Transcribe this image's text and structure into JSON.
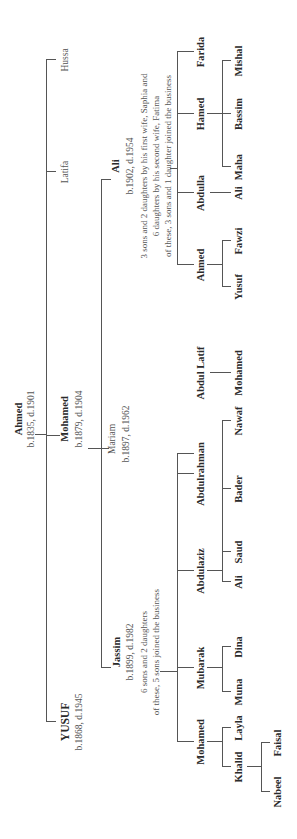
{
  "root": {
    "name": "Ahmed",
    "dates": "b.1835, d.1901"
  },
  "second_wife_line": {
    "name": "Mohamed",
    "dates": "b.1879, d.1904"
  },
  "mariam": {
    "name": "Mariam",
    "dates": "b.1897, d.1962"
  },
  "yusuf": {
    "name": "YUSUF",
    "dates": "b.1868, d.1945"
  },
  "latifa": {
    "name": "Latifa"
  },
  "hussa": {
    "name": "Hussa"
  },
  "jassim": {
    "name": "Jassim",
    "dates": "b.1899, d.1982",
    "note1": "6 sons and 2 daughters",
    "note2": "of these, 5 sons joined the business",
    "children": [
      {
        "name": "Mohamed",
        "children": [
          {
            "name": "Khalid",
            "children": [
              {
                "name": "Nabeel"
              },
              {
                "name": "Faisal"
              }
            ]
          },
          {
            "name": "Layla"
          }
        ]
      },
      {
        "name": "Mubarak",
        "children": [
          {
            "name": "Muna"
          },
          {
            "name": "Dina"
          }
        ]
      },
      {
        "name": "Abdulaziz",
        "children": [
          {
            "name": "Ali"
          },
          {
            "name": "Saud"
          }
        ]
      },
      {
        "name": "Abdulrahman",
        "children": [
          {
            "name": "Bader"
          },
          {
            "name": "Nawaf"
          }
        ]
      },
      {
        "name": "Abdul Latif",
        "children": [
          {
            "name": "Mohamed"
          }
        ]
      }
    ]
  },
  "ali": {
    "name": "Ali",
    "dates": "b.1902, d.1954",
    "note1": "3 sons and 2 daughters by his first wife, Saphia and",
    "note2": "6 daughters by his second wife, Fatima",
    "note3": "of these, 3 sons and 1 daughter  joined the business",
    "children": [
      {
        "name": "Ahmed",
        "children": [
          {
            "name": "Yusuf"
          },
          {
            "name": "Fawzi"
          }
        ]
      },
      {
        "name": "Abdulla",
        "children": [
          {
            "name": "Ali"
          }
        ]
      },
      {
        "name": "Hamed",
        "children": [
          {
            "name": "Maha"
          },
          {
            "name": "Bassim"
          },
          {
            "name": "Mishal"
          }
        ]
      },
      {
        "name": "Farida"
      }
    ]
  }
}
